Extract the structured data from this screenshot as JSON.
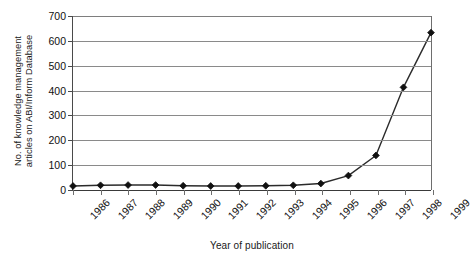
{
  "chart_data": {
    "type": "line",
    "title": "",
    "xlabel": "Year of publication",
    "ylabel": "No. of knowledge management articles on ABI/Inform Database",
    "ylabel_lines": [
      "No. of knowledge management",
      "articles on ABI/Inform Database"
    ],
    "categories": [
      "1986",
      "1987",
      "1988",
      "1989",
      "1990",
      "1991",
      "1992",
      "1993",
      "1994",
      "1995",
      "1996",
      "1997",
      "1998",
      "1999"
    ],
    "values": [
      16,
      19,
      20,
      20,
      17,
      16,
      16,
      17,
      19,
      26,
      58,
      139,
      413,
      633
    ],
    "series": [
      {
        "name": "No. of knowledge management articles on ABI/Inform Database",
        "values": [
          16,
          19,
          20,
          20,
          17,
          16,
          16,
          17,
          19,
          26,
          58,
          139,
          413,
          633
        ]
      }
    ],
    "ylim": [
      0,
      700
    ],
    "yticks": [
      0,
      100,
      200,
      300,
      400,
      500,
      600,
      700
    ],
    "ytick_labels": [
      "0",
      "100",
      "200",
      "300",
      "400",
      "500",
      "600",
      "700"
    ],
    "xtick_labels": [
      "1986",
      "1987",
      "1988",
      "1989",
      "1990",
      "1991",
      "1992",
      "1993",
      "1994",
      "1995",
      "1996",
      "1997",
      "1998",
      "1999"
    ],
    "xtick_rotation": -45,
    "grid": true,
    "grid_axis": "y",
    "legend": false,
    "legend_position": "none",
    "marker": "diamond",
    "line_color": "#2b2b2b",
    "marker_color": "#111111",
    "grid_color": "#8a8a8a",
    "background_color": "#ffffff"
  }
}
